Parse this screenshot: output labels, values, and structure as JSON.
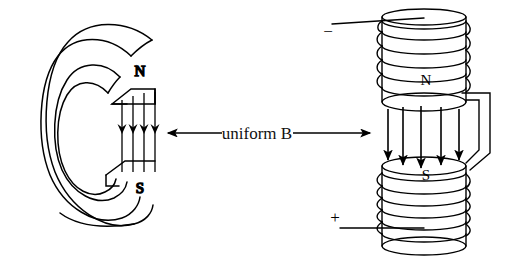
{
  "figure": {
    "title_text": "uniform B",
    "background_color": "#ffffff",
    "stroke_color": "#000000",
    "width": 512,
    "height": 263
  },
  "left_magnet": {
    "name": "toroidal permanent magnet with air gap",
    "pole_top_label": "N",
    "pole_bottom_label": "S",
    "field_line_count": 4,
    "field_direction": "down"
  },
  "center_annotation": {
    "label": "uniform B",
    "arrow_left": "◀",
    "arrow_right": "▶"
  },
  "right_magnet": {
    "name": "split solenoid electromagnet with air gap",
    "pole_top_label": "N",
    "pole_bottom_label": "S",
    "terminal_negative": "−",
    "terminal_positive": "+",
    "field_line_count": 5,
    "field_direction": "down",
    "upper_coil_turns": 6,
    "lower_coil_turns": 7
  }
}
